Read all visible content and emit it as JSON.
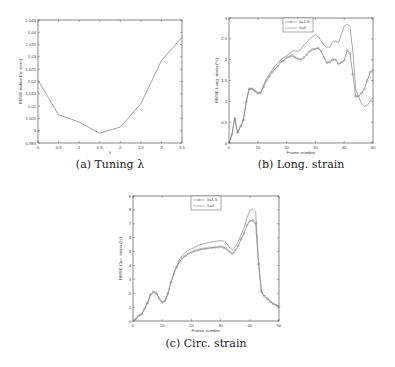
{
  "chart_data": [
    {
      "id": "a",
      "type": "line",
      "title": "",
      "caption": "(a) Tuning λ",
      "xlabel": "λ",
      "ylabel": "RMSE radius Err. (mm)",
      "xlim": [
        0,
        3.5
      ],
      "ylim": [
        0.995,
        1.045
      ],
      "xticks": [
        "0",
        "0.5",
        "1",
        "1.5",
        "2",
        "2.5",
        "3",
        "3.5"
      ],
      "yticks": [
        "0.995",
        "1",
        "1.005",
        "1.01",
        "1.015",
        "1.02",
        "1.025",
        "1.03",
        "1.035",
        "1.04",
        "1.045"
      ],
      "grid": false,
      "legend": null,
      "series": [
        {
          "name": "RMSE",
          "marker": "none",
          "x": [
            0,
            0.5,
            1,
            1.5,
            2,
            2.5,
            3,
            3.5
          ],
          "values": [
            1.0205,
            1.0065,
            1.0035,
            0.999,
            1.0015,
            1.011,
            1.0285,
            1.038
          ]
        }
      ]
    },
    {
      "id": "b",
      "type": "line",
      "title": "",
      "caption": "(b) Long. strain",
      "xlabel": "Frame number",
      "ylabel": "RMSE Long. strain (%)",
      "xlim": [
        0,
        50
      ],
      "ylim": [
        0,
        3
      ],
      "xticks": [
        "0",
        "10",
        "20",
        "30",
        "40",
        "50"
      ],
      "yticks": [
        "0",
        "0.5",
        "1",
        "1.5",
        "2",
        "2.5",
        "3"
      ],
      "grid": false,
      "legend": {
        "position": "top-center",
        "entries": [
          "λ=1.5",
          "λ=0"
        ]
      },
      "series": [
        {
          "name": "λ=1.5",
          "marker": "circle",
          "x": [
            0,
            1,
            2,
            3,
            4,
            5,
            6,
            7,
            8,
            9,
            10,
            11,
            12,
            13,
            14,
            15,
            16,
            17,
            18,
            19,
            20,
            21,
            22,
            23,
            24,
            25,
            26,
            27,
            28,
            29,
            30,
            31,
            32,
            33,
            34,
            35,
            36,
            37,
            38,
            39,
            40,
            41,
            42,
            43,
            44,
            45,
            46,
            47,
            48,
            49,
            50
          ],
          "values": [
            0,
            0.2,
            0.6,
            0.25,
            0.4,
            0.55,
            1.0,
            1.3,
            1.3,
            1.25,
            1.2,
            1.2,
            1.35,
            1.5,
            1.6,
            1.7,
            1.78,
            1.85,
            1.95,
            1.98,
            2.05,
            2.07,
            2.1,
            2.05,
            2.02,
            2.0,
            2.05,
            2.12,
            2.2,
            2.25,
            2.26,
            2.28,
            2.2,
            2.05,
            1.93,
            1.95,
            2.0,
            2.0,
            1.9,
            1.93,
            1.98,
            2.22,
            2.15,
            1.65,
            1.12,
            1.12,
            1.2,
            1.3,
            1.5,
            1.7,
            1.75
          ]
        },
        {
          "name": "λ=0",
          "marker": "none",
          "x": [
            0,
            1,
            2,
            3,
            4,
            5,
            6,
            7,
            8,
            9,
            10,
            11,
            12,
            13,
            14,
            15,
            16,
            17,
            18,
            19,
            20,
            21,
            22,
            23,
            24,
            25,
            26,
            27,
            28,
            29,
            30,
            31,
            32,
            33,
            34,
            35,
            36,
            37,
            38,
            39,
            40,
            41,
            42,
            43,
            44,
            45,
            46,
            47,
            48,
            49,
            50
          ],
          "values": [
            0,
            0.2,
            0.6,
            0.25,
            0.4,
            0.55,
            1.0,
            1.3,
            1.3,
            1.25,
            1.2,
            1.2,
            1.38,
            1.55,
            1.65,
            1.75,
            1.85,
            1.92,
            2.0,
            2.05,
            2.1,
            2.15,
            2.2,
            2.22,
            2.2,
            2.25,
            2.35,
            2.42,
            2.5,
            2.55,
            2.6,
            2.55,
            2.45,
            2.35,
            2.3,
            2.3,
            2.42,
            2.45,
            2.4,
            2.6,
            2.8,
            2.85,
            2.8,
            2.2,
            1.3,
            1.1,
            0.95,
            0.88,
            0.9,
            1.0,
            1.1
          ]
        }
      ]
    },
    {
      "id": "c",
      "type": "line",
      "title": "",
      "caption": "(c) Circ. strain",
      "xlabel": "Frame number",
      "ylabel": "RMSE Circ. strain (%)",
      "xlim": [
        0,
        50
      ],
      "ylim": [
        0,
        9
      ],
      "xticks": [
        "0",
        "10",
        "20",
        "30",
        "40",
        "50"
      ],
      "yticks": [
        "0",
        "1",
        "2",
        "3",
        "4",
        "5",
        "6",
        "7",
        "8",
        "9"
      ],
      "grid": false,
      "legend": {
        "position": "top-center",
        "entries": [
          "λ=1.5",
          "λ=0"
        ]
      },
      "series": [
        {
          "name": "λ=1.5",
          "marker": "circle",
          "x": [
            0,
            1,
            2,
            3,
            4,
            5,
            6,
            7,
            8,
            9,
            10,
            11,
            12,
            13,
            14,
            15,
            16,
            17,
            18,
            19,
            20,
            21,
            22,
            23,
            24,
            25,
            26,
            27,
            28,
            29,
            30,
            31,
            32,
            33,
            34,
            35,
            36,
            37,
            38,
            39,
            40,
            41,
            42,
            43,
            44,
            45,
            46,
            47,
            48,
            49,
            50
          ],
          "values": [
            0,
            0.15,
            0.4,
            0.5,
            0.9,
            1.3,
            1.9,
            2.1,
            2.0,
            1.6,
            1.35,
            1.45,
            2.0,
            2.8,
            3.4,
            3.9,
            4.3,
            4.55,
            4.7,
            4.85,
            4.95,
            5.05,
            5.1,
            5.15,
            5.2,
            5.22,
            5.25,
            5.28,
            5.3,
            5.32,
            5.35,
            5.3,
            5.2,
            5.0,
            4.85,
            5.1,
            5.4,
            5.9,
            6.3,
            6.9,
            7.2,
            7.25,
            7.05,
            4.1,
            2.1,
            1.8,
            1.6,
            1.4,
            1.25,
            1.15,
            1.05
          ]
        },
        {
          "name": "λ=0",
          "marker": "none",
          "x": [
            0,
            1,
            2,
            3,
            4,
            5,
            6,
            7,
            8,
            9,
            10,
            11,
            12,
            13,
            14,
            15,
            16,
            17,
            18,
            19,
            20,
            21,
            22,
            23,
            24,
            25,
            26,
            27,
            28,
            29,
            30,
            31,
            32,
            33,
            34,
            35,
            36,
            37,
            38,
            39,
            40,
            41,
            42,
            43,
            44,
            45,
            46,
            47,
            48,
            49,
            50
          ],
          "values": [
            0,
            0.15,
            0.4,
            0.5,
            0.9,
            1.3,
            1.9,
            2.1,
            2.0,
            1.6,
            1.35,
            1.45,
            2.0,
            2.8,
            3.45,
            4.0,
            4.45,
            4.75,
            4.95,
            5.1,
            5.2,
            5.3,
            5.4,
            5.48,
            5.55,
            5.6,
            5.65,
            5.7,
            5.73,
            5.76,
            5.78,
            5.75,
            5.6,
            5.3,
            5.15,
            5.35,
            5.7,
            6.2,
            6.7,
            7.4,
            7.95,
            8.05,
            7.85,
            4.3,
            2.1,
            1.8,
            1.6,
            1.4,
            1.25,
            1.15,
            1.05
          ]
        }
      ]
    }
  ],
  "captions": {
    "a": "(a) Tuning λ",
    "b": "(b) Long. strain",
    "c": "(c) Circ. strain"
  }
}
